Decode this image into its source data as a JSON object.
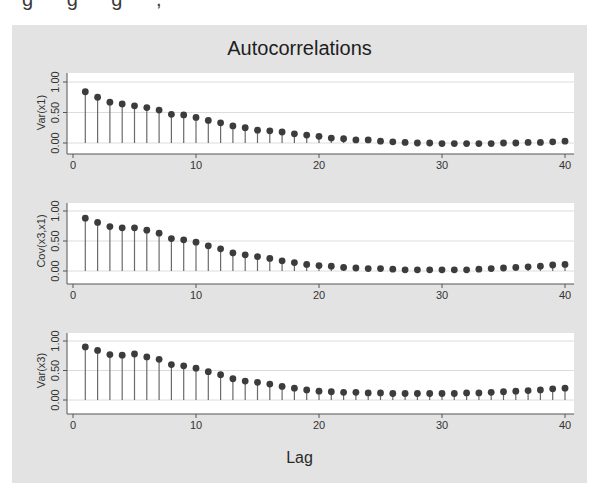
{
  "top_fragment": "g g g ,",
  "chart_data": {
    "type": "bar",
    "subtype": "stem",
    "title": "Autocorrelations",
    "xlabel": "Lag",
    "x": [
      1,
      2,
      3,
      4,
      5,
      6,
      7,
      8,
      9,
      10,
      11,
      12,
      13,
      14,
      15,
      16,
      17,
      18,
      19,
      20,
      21,
      22,
      23,
      24,
      25,
      26,
      27,
      28,
      29,
      30,
      31,
      32,
      33,
      34,
      35,
      36,
      37,
      38,
      39,
      40
    ],
    "xlim": [
      0,
      40
    ],
    "xticks": [
      0,
      10,
      20,
      30,
      40
    ],
    "yticks": [
      0.0,
      0.5,
      1.0
    ],
    "ytick_labels": [
      "0.00",
      "0.50",
      "1.00"
    ],
    "grid": true,
    "legend": null,
    "panels": [
      {
        "ylabel": "Var(x1)",
        "ylim": [
          -0.1,
          1.1
        ],
        "values": [
          0.84,
          0.75,
          0.67,
          0.64,
          0.61,
          0.58,
          0.54,
          0.47,
          0.46,
          0.42,
          0.37,
          0.33,
          0.28,
          0.25,
          0.21,
          0.2,
          0.18,
          0.15,
          0.13,
          0.11,
          0.08,
          0.07,
          0.05,
          0.05,
          0.03,
          0.02,
          0.01,
          0.0,
          0.0,
          -0.01,
          -0.01,
          -0.01,
          -0.01,
          -0.01,
          0.0,
          0.0,
          0.01,
          0.01,
          0.02,
          0.03
        ]
      },
      {
        "ylabel": "Cov(x3,x1)",
        "ylim": [
          -0.1,
          1.1
        ],
        "values": [
          0.88,
          0.81,
          0.74,
          0.72,
          0.72,
          0.68,
          0.63,
          0.54,
          0.52,
          0.48,
          0.42,
          0.37,
          0.3,
          0.27,
          0.24,
          0.21,
          0.17,
          0.14,
          0.11,
          0.09,
          0.08,
          0.06,
          0.05,
          0.04,
          0.04,
          0.03,
          0.02,
          0.02,
          0.02,
          0.02,
          0.02,
          0.02,
          0.03,
          0.04,
          0.05,
          0.06,
          0.07,
          0.08,
          0.1,
          0.11
        ]
      },
      {
        "ylabel": "Var(x3)",
        "ylim": [
          -0.1,
          1.1
        ],
        "values": [
          0.9,
          0.84,
          0.77,
          0.76,
          0.78,
          0.73,
          0.69,
          0.6,
          0.58,
          0.54,
          0.48,
          0.43,
          0.36,
          0.32,
          0.3,
          0.27,
          0.23,
          0.2,
          0.17,
          0.15,
          0.14,
          0.13,
          0.13,
          0.12,
          0.12,
          0.11,
          0.11,
          0.11,
          0.11,
          0.11,
          0.11,
          0.12,
          0.12,
          0.13,
          0.14,
          0.15,
          0.16,
          0.17,
          0.19,
          0.2
        ]
      }
    ]
  },
  "colors": {
    "frame_bg": "#e3e3e3",
    "plot_bg": "#ffffff",
    "grid": "#dcdcdc",
    "stem": "#6a6a6a",
    "marker": "#3c3c3c",
    "axis": "#555555",
    "text": "#333333"
  }
}
